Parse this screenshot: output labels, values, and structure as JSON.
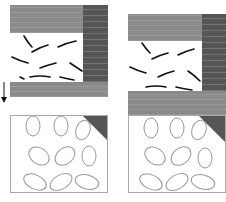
{
  "figure": {
    "panels": [
      {
        "id": "left",
        "description": "Layered texture panel with dark strokes and leaf pattern"
      },
      {
        "id": "right",
        "description": "Shifted layered texture panel with dark strokes and leaf pattern"
      }
    ],
    "arrow": {
      "direction": "down"
    },
    "colors": {
      "band": "#8a8a8a",
      "dark": "#555555",
      "leaf_stroke": "#9a9a9a",
      "stroke": "#111111"
    }
  }
}
